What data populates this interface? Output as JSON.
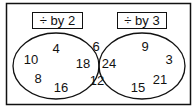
{
  "sets": [
    {
      "label": "÷ by 2",
      "only": [
        "4",
        "10",
        "8",
        "16"
      ]
    },
    {
      "label": "÷ by 3",
      "only": [
        "9",
        "3",
        "21",
        "15"
      ]
    }
  ],
  "intersection": [
    "6",
    "18",
    "24",
    "12"
  ],
  "colors": {
    "stroke": "#111111",
    "background": "#ffffff"
  }
}
